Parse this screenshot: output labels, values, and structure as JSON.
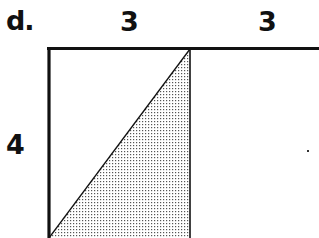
{
  "figure": {
    "part_label": "d.",
    "dimensions": {
      "top_left_width": "3",
      "top_right_width": "3",
      "left_height": "4"
    },
    "colors": {
      "line": "#111111",
      "stipple": "#555555",
      "background": "#ffffff"
    },
    "shapes": {
      "rectangle": "left rectangle 3 wide by 4 tall, bordered on top and left with thick lines, right side thin",
      "shaded_triangle": "right triangle with vertices bottom-left, top-right, bottom-right of left rectangle, stippled fill",
      "top_extension": "top line continues across right section of width 3"
    }
  }
}
